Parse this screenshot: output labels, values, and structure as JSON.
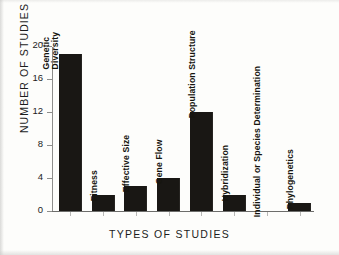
{
  "chart_data": {
    "type": "bar",
    "title": "",
    "xlabel": "TYPES OF STUDIES",
    "ylabel": "NUMBER OF STUDIES",
    "categories": [
      "Genetic Diversity",
      "Fitness",
      "Effective Size",
      "Gene Flow",
      "Population Structure",
      "Hybridization",
      "Individual or Species Determination",
      "Phylogenetics"
    ],
    "values": [
      19,
      2,
      3,
      4,
      12,
      2,
      0,
      1
    ],
    "ylim": [
      0,
      20
    ],
    "yticks": [
      0,
      4,
      8,
      12,
      16,
      20
    ],
    "ytick_labels": [
      "0",
      "4",
      "8",
      "12",
      "16",
      "20"
    ],
    "grid": false,
    "legend": false,
    "bar_color": "#191714",
    "axis_color": "#6d6d6b",
    "label_orientation": "vertical"
  }
}
